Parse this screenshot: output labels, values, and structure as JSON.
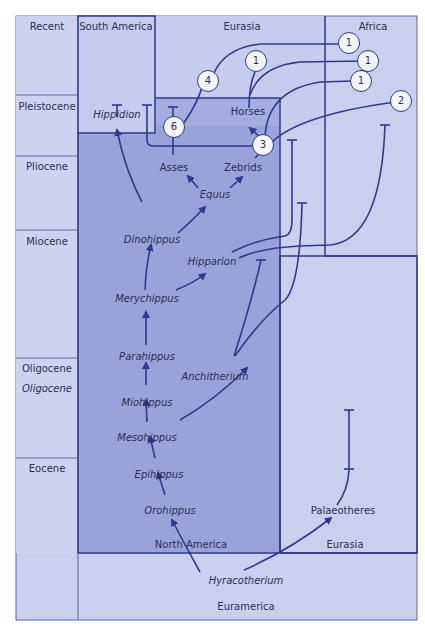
{
  "colors": {
    "light_fill": "#c9d0ee",
    "mid_fill": "#b7c0e8",
    "dark_fill": "#98a3d9",
    "line": "#2c3a8c",
    "text": "#2a2f55"
  },
  "epochs": [
    "Recent",
    "Pleistocene",
    "Pliocene",
    "Miocene",
    "Oligocene",
    "Oligocene",
    "Eocene"
  ],
  "regions": {
    "south_america": "South America",
    "eurasia_top": "Eurasia",
    "africa": "Africa",
    "north_america": "North America",
    "eurasia_bottom": "Eurasia",
    "euramerica": "Euramerica"
  },
  "taxa": {
    "hippidion": "Hippidion",
    "horses": "Horses",
    "asses": "Asses",
    "zebrids": "Zebrids",
    "equus": "Equus",
    "dinohippus": "Dinohippus",
    "hipparion": "Hipparion",
    "merychippus": "Merychippus",
    "parahippus": "Parahippus",
    "anchitherium": "Anchitherium",
    "miohippus": "Miohippus",
    "mesohippus": "Mesohippus",
    "epihippus": "Epihippus",
    "orohippus": "Orohippus",
    "palaeotheres": "Palaeotheres",
    "hyracotherium": "Hyracotherium"
  },
  "markers": [
    "1",
    "1",
    "1",
    "1",
    "2",
    "3",
    "4",
    "6"
  ]
}
